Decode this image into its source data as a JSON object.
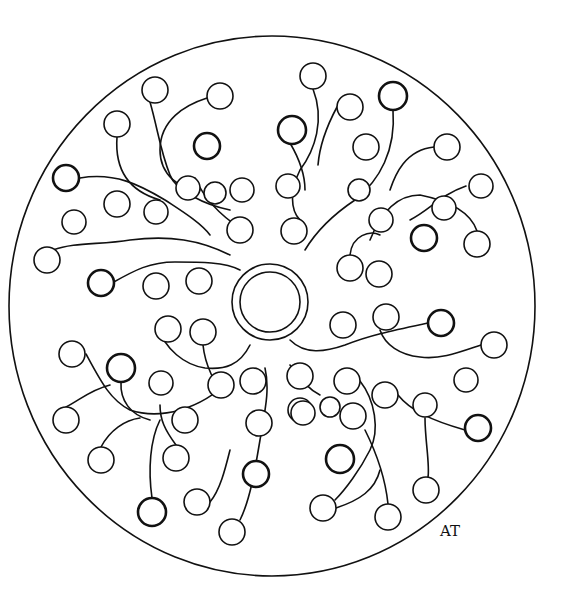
{
  "artwork": {
    "type": "mandala coloring page",
    "signature": "AT",
    "outer": {
      "cx": 272,
      "cy": 306,
      "rx": 263,
      "ry": 270
    },
    "center_ring": {
      "cx": 270,
      "cy": 302,
      "outer_r": 38,
      "inner_r": 30
    },
    "balls": [
      [
        155,
        90,
        13,
        0
      ],
      [
        220,
        96,
        13,
        0
      ],
      [
        117,
        124,
        13,
        0
      ],
      [
        207,
        146,
        13,
        1
      ],
      [
        66,
        178,
        13,
        1
      ],
      [
        117,
        204,
        13,
        0
      ],
      [
        156,
        212,
        12,
        0
      ],
      [
        74,
        222,
        12,
        0
      ],
      [
        47,
        260,
        13,
        0
      ],
      [
        101,
        283,
        13,
        1
      ],
      [
        156,
        286,
        13,
        0
      ],
      [
        199,
        281,
        13,
        0
      ],
      [
        188,
        188,
        12,
        0
      ],
      [
        215,
        193,
        11,
        0
      ],
      [
        242,
        190,
        12,
        0
      ],
      [
        240,
        230,
        13,
        0
      ],
      [
        288,
        186,
        12,
        0
      ],
      [
        294,
        231,
        13,
        0
      ],
      [
        313,
        76,
        13,
        0
      ],
      [
        350,
        107,
        13,
        0
      ],
      [
        393,
        96,
        14,
        1
      ],
      [
        292,
        130,
        14,
        1
      ],
      [
        366,
        147,
        13,
        0
      ],
      [
        447,
        147,
        13,
        0
      ],
      [
        359,
        190,
        11,
        0
      ],
      [
        381,
        220,
        12,
        0
      ],
      [
        424,
        238,
        13,
        1
      ],
      [
        477,
        244,
        13,
        0
      ],
      [
        350,
        268,
        13,
        0
      ],
      [
        379,
        274,
        13,
        0
      ],
      [
        481,
        186,
        12,
        0
      ],
      [
        444,
        208,
        12,
        0
      ],
      [
        343,
        325,
        13,
        0
      ],
      [
        386,
        317,
        13,
        0
      ],
      [
        441,
        323,
        13,
        1
      ],
      [
        494,
        345,
        13,
        0
      ],
      [
        168,
        329,
        13,
        0
      ],
      [
        203,
        332,
        13,
        0
      ],
      [
        72,
        354,
        13,
        0
      ],
      [
        121,
        368,
        14,
        1
      ],
      [
        161,
        383,
        12,
        0
      ],
      [
        221,
        385,
        13,
        0
      ],
      [
        253,
        381,
        13,
        0
      ],
      [
        300,
        376,
        13,
        0
      ],
      [
        347,
        381,
        13,
        0
      ],
      [
        385,
        395,
        13,
        0
      ],
      [
        466,
        380,
        12,
        0
      ],
      [
        425,
        405,
        12,
        0
      ],
      [
        300,
        410,
        12,
        0
      ],
      [
        330,
        407,
        10,
        0
      ],
      [
        66,
        420,
        13,
        0
      ],
      [
        185,
        420,
        13,
        0
      ],
      [
        259,
        423,
        13,
        0
      ],
      [
        303,
        413,
        12,
        0
      ],
      [
        353,
        416,
        13,
        0
      ],
      [
        478,
        428,
        13,
        1
      ],
      [
        101,
        460,
        13,
        0
      ],
      [
        176,
        458,
        13,
        0
      ],
      [
        256,
        474,
        13,
        1
      ],
      [
        340,
        459,
        14,
        1
      ],
      [
        426,
        490,
        13,
        0
      ],
      [
        152,
        512,
        14,
        1
      ],
      [
        197,
        502,
        13,
        0
      ],
      [
        323,
        508,
        13,
        0
      ],
      [
        388,
        517,
        13,
        0
      ],
      [
        232,
        532,
        13,
        0
      ]
    ],
    "stems": [
      "M150,102 C158,130 160,150 170,175 C175,190 205,205 230,210",
      "M207,98 C185,105 160,120 160,150 C160,175 180,190 200,190",
      "M117,137 C115,165 125,190 160,200",
      "M80,178 C115,172 140,185 165,200 C180,210 200,222 210,235",
      "M53,250 C75,242 100,245 130,240 C170,235 200,240 230,255",
      "M112,283 C135,270 150,262 175,262 C200,262 225,262 240,270",
      "M195,178 C205,200 220,215 240,228",
      "M313,89 C325,120 315,150 300,170 C290,190 290,210 300,220",
      "M337,107 C330,120 320,140 318,165",
      "M393,110 C396,150 380,180 355,200 C340,210 320,225 305,250",
      "M434,147 C405,150 395,175 390,190",
      "M466,186 C440,195 430,210 410,220",
      "M477,231 C470,210 445,200 420,195 C395,195 380,215 370,240",
      "M350,255 C352,235 370,230 380,235",
      "M290,143 C300,160 305,175 305,190",
      "M428,323 C395,330 370,335 345,345 C325,352 305,355 290,340",
      "M481,345 C460,352 440,360 420,357 C400,355 385,345 380,330",
      "M157,325 C165,350 185,365 205,368 C225,370 240,365 250,345",
      "M203,345 C205,365 215,385 225,395",
      "M86,354 C100,380 110,400 130,410 C160,420 200,410 230,380",
      "M121,382 C120,400 130,415 150,420",
      "M66,407 C80,400 90,390 110,385",
      "M265,368 C270,390 265,410 260,440 C255,470 250,500 240,520",
      "M290,365 C300,380 310,390 320,395",
      "M360,381 C375,400 380,430 370,450 C360,470 345,490 335,500",
      "M398,395 C410,410 430,420 465,430",
      "M425,418 C425,440 430,465 428,477",
      "M101,447 C110,430 125,420 140,418",
      "M176,445 C165,430 160,420 160,405",
      "M152,498 C148,470 150,440 160,420",
      "M210,502 C220,490 225,470 230,450",
      "M388,504 C385,475 375,450 365,430",
      "M336,508 C360,500 375,490 380,470"
    ]
  }
}
